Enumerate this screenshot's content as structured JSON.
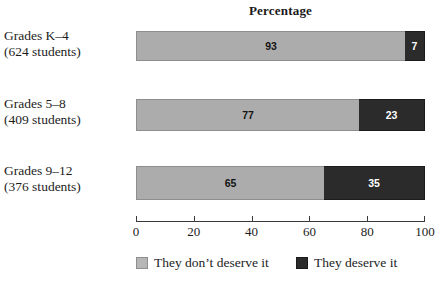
{
  "chart_data": {
    "type": "bar",
    "orientation": "horizontal",
    "stacked": true,
    "stack_total": 100,
    "title": "Percentage",
    "xlabel": "",
    "ylabel": "",
    "xlim": [
      0,
      100
    ],
    "grid": false,
    "legend_position": "bottom",
    "axis_ticks": [
      "0",
      "20",
      "40",
      "60",
      "80",
      "100"
    ],
    "axis_tick_values": [
      0,
      20,
      40,
      60,
      80,
      100
    ],
    "categories": [
      "Grades K–4 (624 students)",
      "Grades 5–8 (409 students)",
      "Grades 9–12 (376 students)"
    ],
    "category_labels": [
      {
        "line1": "Grades K–4",
        "line2": "(624 students)",
        "students": 624
      },
      {
        "line1": "Grades 5–8",
        "line2": "(409 students)",
        "students": 409
      },
      {
        "line1": "Grades 9–12",
        "line2": "(376 students)",
        "students": 376
      }
    ],
    "series": [
      {
        "name": "They don't deserve it",
        "color": "#acacac",
        "values": [
          93,
          77,
          65
        ],
        "labels": [
          "93",
          "77",
          "65"
        ]
      },
      {
        "name": "They deserve it",
        "color": "#2b2b2b",
        "values": [
          7,
          23,
          35
        ],
        "labels": [
          "7",
          "23",
          "35"
        ]
      }
    ],
    "legend": [
      {
        "label": "They don’t deserve it",
        "color": "#acacac"
      },
      {
        "label": "They deserve it",
        "color": "#2b2b2b"
      }
    ]
  }
}
